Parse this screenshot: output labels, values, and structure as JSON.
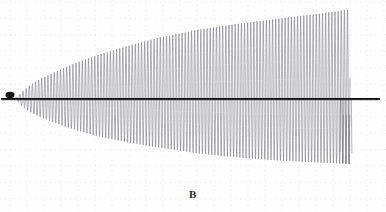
{
  "figure": {
    "caption": "B",
    "background_color": "#fefefe",
    "grid": {
      "visible": true,
      "style": "dotted",
      "color": "#e9e9ef",
      "x_spacing_px": 17,
      "y_spacing_px": 16.4,
      "x_origin_px": 10,
      "y_origin_px": 2
    },
    "axis": {
      "centerline_color": "#101010",
      "centerline_y_px": 99,
      "centerline_x_start_px": 2,
      "centerline_x_end_px": 379
    },
    "marker_blob": {
      "name": "origin-blob",
      "color": "#161616",
      "cx_px": 10,
      "cy_px": 95,
      "rx_px": 4.5,
      "ry_px": 3.2
    }
  },
  "chart_data": {
    "type": "line",
    "title": "",
    "subtitle": "",
    "xlabel": "",
    "ylabel": "",
    "annotations": [
      "B"
    ],
    "legend": [],
    "legend_position": "none",
    "grid": true,
    "xlim": [
      0,
      386
    ],
    "ylim": [
      -100,
      100
    ],
    "series": [
      {
        "name": "oscillation",
        "color": "#6d6d75",
        "line_width_px": 0.55,
        "x_start_px": 16,
        "x_end_px": 350,
        "period_px": 3.12,
        "phase_deg": 0,
        "envelope": {
          "type": "piecewise-linear",
          "upper_points": [
            [
              16,
              98
            ],
            [
              22,
              92
            ],
            [
              30,
              85
            ],
            [
              40,
              79
            ],
            [
              55,
              72
            ],
            [
              75,
              63
            ],
            [
              100,
              54
            ],
            [
              130,
              45
            ],
            [
              160,
              37
            ],
            [
              200,
              29
            ],
            [
              240,
              23
            ],
            [
              280,
              18
            ],
            [
              320,
              13
            ],
            [
              342,
              10
            ],
            [
              348,
              9
            ]
          ],
          "lower_points": [
            [
              16,
              100
            ],
            [
              22,
              106
            ],
            [
              30,
              112
            ],
            [
              40,
              117
            ],
            [
              55,
              123
            ],
            [
              75,
              130
            ],
            [
              100,
              137
            ],
            [
              130,
              143
            ],
            [
              160,
              148
            ],
            [
              200,
              154
            ],
            [
              240,
              158
            ],
            [
              280,
              161
            ],
            [
              320,
              163
            ],
            [
              345,
              164
            ],
            [
              352,
              165
            ]
          ]
        },
        "tail": {
          "description": "trailing dark zero-line beyond oscillation cutoff",
          "x_from_px": 350,
          "x_to_px": 379,
          "y_px": 99
        }
      }
    ]
  }
}
